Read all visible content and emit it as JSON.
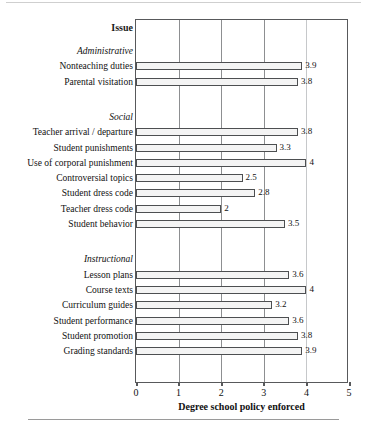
{
  "figure": {
    "issue_heading": "Issue",
    "xaxis_title": "Degree school policy enforced",
    "xticks": [
      "0",
      "1",
      "2",
      "3",
      "4",
      "5"
    ]
  },
  "chart_data": {
    "type": "bar",
    "orientation": "horizontal",
    "title": "",
    "xlabel": "Degree school policy enforced",
    "ylabel": "Issue",
    "xlim": [
      0,
      5
    ],
    "xticks": [
      0,
      1,
      2,
      3,
      4,
      5
    ],
    "grid": "vertical",
    "legend": "none",
    "groups": [
      {
        "name": "Administrative",
        "categories": [
          "Nonteaching duties",
          "Parental visitation"
        ],
        "values": [
          3.9,
          3.8
        ],
        "labels": [
          "3.9",
          "3.8"
        ]
      },
      {
        "name": "Social",
        "categories": [
          "Teacher arrival / departure",
          "Student punishments",
          "Use of corporal punishment",
          "Controversial topics",
          "Student dress code",
          "Teacher dress code",
          "Student behavior"
        ],
        "values": [
          3.8,
          3.3,
          4,
          2.5,
          2.8,
          2,
          3.5
        ],
        "labels": [
          "3.8",
          "3.3",
          "4",
          "2.5",
          "2.8",
          "2",
          "3.5"
        ]
      },
      {
        "name": "Instructional",
        "categories": [
          "Lesson plans",
          "Course texts",
          "Curriculum guides",
          "Student performance",
          "Student promotion",
          "Grading standards"
        ],
        "values": [
          3.6,
          4,
          3.2,
          3.6,
          3.8,
          3.9
        ],
        "labels": [
          "3.6",
          "4",
          "3.2",
          "3.6",
          "3.8",
          "3.9"
        ]
      }
    ],
    "categories": [
      "Nonteaching duties",
      "Parental visitation",
      "Teacher arrival / departure",
      "Student punishments",
      "Use of corporal punishment",
      "Controversial topics",
      "Student dress code",
      "Teacher dress code",
      "Student behavior",
      "Lesson plans",
      "Course texts",
      "Curriculum guides",
      "Student performance",
      "Student promotion",
      "Grading standards"
    ],
    "values": [
      3.9,
      3.8,
      3.8,
      3.3,
      4,
      2.5,
      2.8,
      2,
      3.5,
      3.6,
      4,
      3.2,
      3.6,
      3.8,
      3.9
    ]
  }
}
